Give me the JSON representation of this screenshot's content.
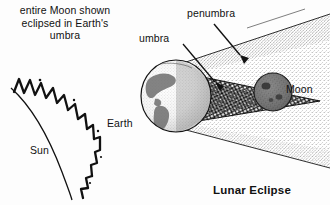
{
  "figure": {
    "title": "Lunar Eclipse",
    "caption_bottom": "Lunar Eclipse",
    "left_caption": "entire Moon shown eclipsed in Earth's umbra",
    "left_caption_lines": [
      "entire Moon",
      "shown eclipsed",
      "in Earth's",
      "umbra"
    ]
  },
  "labels": {
    "sun": "Sun",
    "earth": "Earth",
    "umbra": "umbra",
    "penumbra": "penumbra",
    "moon": "Moon"
  },
  "colors": {
    "ink": "#111111",
    "paper": "#fdfdfd",
    "umbra_fill": "#3a3a3a",
    "penumbra_fill": "#9a9a9a",
    "moon_fill": "#4a4a4a"
  },
  "elements": {
    "sun_limb": "sun-arc-with-flares",
    "earth_globe": "earth-sphere-with-continents",
    "umbra_cone": "dark-shadow-cone",
    "penumbra_cone": "light-shadow-cone",
    "moon_disc": "moon-in-umbra",
    "umbra_leader": "leader-line",
    "penumbra_arrow": "arrow-pointer"
  }
}
